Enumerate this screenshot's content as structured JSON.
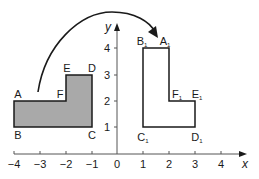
{
  "diagram": {
    "type": "coordinate-transformation",
    "colors": {
      "axis": "#555555",
      "shape_stroke": "#1a1a1a",
      "shaded_fill": "#a9a9a9",
      "image_fill": "#ffffff",
      "arrow": "#1a1a1a"
    },
    "axes": {
      "x_label": "x",
      "y_label": "y",
      "origin_label": "0",
      "x_ticks": [
        "−4",
        "−3",
        "−2",
        "−1",
        "1",
        "2",
        "3",
        "4"
      ],
      "y_ticks": [
        "1",
        "2",
        "3",
        "4"
      ]
    },
    "original_shape": {
      "name": "ABCDEF",
      "shaded": true,
      "vertices": [
        {
          "label": "A",
          "x": -4,
          "y": 2
        },
        {
          "label": "B",
          "x": -4,
          "y": 1
        },
        {
          "label": "C",
          "x": -1,
          "y": 1
        },
        {
          "label": "D",
          "x": -1,
          "y": 3
        },
        {
          "label": "E",
          "x": -2,
          "y": 3
        },
        {
          "label": "F",
          "x": -2,
          "y": 2
        }
      ]
    },
    "image_shape": {
      "name": "A1B1C1D1E1F1",
      "shaded": false,
      "vertices": [
        {
          "label": "A",
          "sub": "1",
          "x": 2,
          "y": 4
        },
        {
          "label": "B",
          "sub": "1",
          "x": 1,
          "y": 4
        },
        {
          "label": "C",
          "sub": "1",
          "x": 1,
          "y": 1
        },
        {
          "label": "D",
          "sub": "1",
          "x": 3,
          "y": 1
        },
        {
          "label": "E",
          "sub": "1",
          "x": 3,
          "y": 2
        },
        {
          "label": "F",
          "sub": "1",
          "x": 2,
          "y": 2
        }
      ]
    },
    "arrow": {
      "from": "original_shape",
      "to": "image_shape",
      "style": "curved"
    }
  }
}
